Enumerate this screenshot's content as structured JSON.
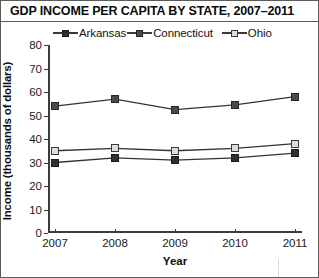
{
  "chart_data": {
    "type": "line",
    "title": "GDP INCOME PER CAPITA BY STATE, 2007–2011",
    "xlabel": "Year",
    "ylabel": "Income (thousands of dollars)",
    "categories": [
      "2007",
      "2008",
      "2009",
      "2010",
      "2011"
    ],
    "x": [
      2007,
      2008,
      2009,
      2010,
      2011
    ],
    "ylim": [
      0,
      80
    ],
    "yticks": [
      0,
      10,
      20,
      30,
      40,
      50,
      60,
      70,
      80
    ],
    "grid": false,
    "legend_position": "top",
    "series": [
      {
        "name": "Arkansas",
        "marker": "filled-square-dark",
        "color": "#2f2f2f",
        "values": [
          30,
          32,
          31,
          32,
          34
        ]
      },
      {
        "name": "Connecticut",
        "marker": "filled-square-mid",
        "color": "#4a4a4a",
        "values": [
          54,
          57,
          52.5,
          54.5,
          58
        ]
      },
      {
        "name": "Ohio",
        "marker": "open-square-light",
        "color": "#dcdcdc",
        "values": [
          35,
          36,
          35,
          36,
          38
        ]
      }
    ]
  },
  "legend": {
    "items": [
      {
        "label": "Arkansas"
      },
      {
        "label": "Connecticut"
      },
      {
        "label": "Ohio"
      }
    ]
  }
}
